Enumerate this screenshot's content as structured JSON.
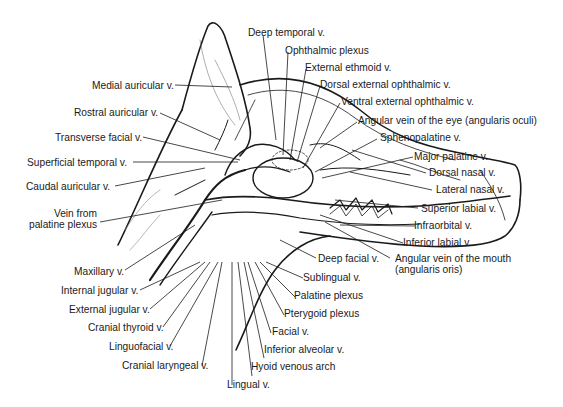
{
  "diagram": {
    "labels": {
      "deep_temporal": "Deep temporal v.",
      "ophthalmic_plexus": "Ophthalmic plexus",
      "external_ethmoid": "External ethmoid v.",
      "dorsal_external_ophthalmic": "Dorsal external ophthalmic v.",
      "ventral_external_ophthalmic": "Ventral external ophthalmic v.",
      "angular_eye": "Angular vein of the eye (angularis oculi)",
      "sphenopalatine": "Sphenopalatine v.",
      "major_palatine": "Major palatine v.",
      "dorsal_nasal": "Dorsal nasal v.",
      "lateral_nasal": "Lateral nasal v.",
      "superior_labial": "Superior labial v.",
      "infraorbital": "Infraorbital v.",
      "inferior_labial": "Inferior labial v.",
      "angular_mouth_1": "Angular vein of the mouth",
      "angular_mouth_2": "(angularis oris)",
      "deep_facial": "Deep facial v.",
      "sublingual": "Sublingual v.",
      "palatine_plexus": "Palatine plexus",
      "pterygoid_plexus": "Pterygoid plexus",
      "facial": "Facial v.",
      "inferior_alveolar": "Inferior alveolar v.",
      "hyoid_venous_arch": "Hyoid venous arch",
      "lingual": "Lingual v.",
      "cranial_laryngeal": "Cranial laryngeal v.",
      "linguofacial": "Linguofacial v.",
      "cranial_thyroid": "Cranial thyroid v.",
      "external_jugular": "External jugular v.",
      "internal_jugular": "Internal jugular v.",
      "maxillary": "Maxillary v.",
      "vein_from_palatine_1": "Vein from",
      "vein_from_palatine_2": "palatine plexus",
      "caudal_auricular": "Caudal auricular v.",
      "superficial_temporal": "Superficial temporal v.",
      "transverse_facial": "Transverse facial v.",
      "rostral_auricular": "Rostral auricular v.",
      "medial_auricular": "Medial auricular v."
    }
  }
}
